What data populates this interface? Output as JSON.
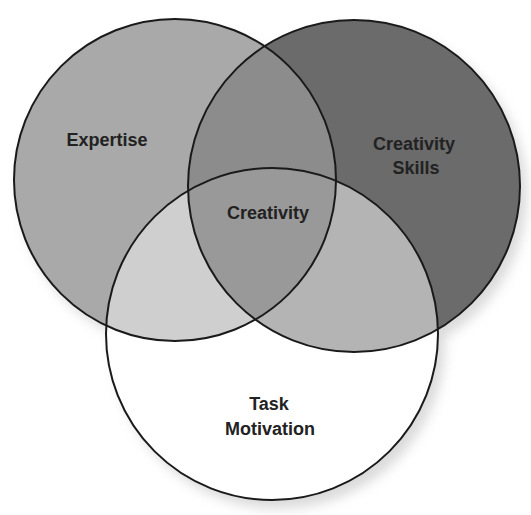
{
  "diagram": {
    "type": "venn",
    "colors": {
      "background": "#ffffff",
      "outline": "#1a1a1a",
      "expertise_only": "#a9a9a9",
      "skills_only": "#6b6b6b",
      "task_only": "#ffffff",
      "expertise_skills": "#8c8c8c",
      "expertise_task": "#cfcfcf",
      "skills_task": "#b4b4b4",
      "center": "#999999",
      "shadow": "#c8c8c8"
    },
    "circles": [
      {
        "id": "expertise",
        "label_lines": [
          "Expertise"
        ],
        "cx": 175,
        "cy": 180,
        "r": 161
      },
      {
        "id": "creativity_skills",
        "label_lines": [
          "Creativity",
          "Skills"
        ],
        "cx": 354,
        "cy": 186,
        "r": 166
      },
      {
        "id": "task_motivation",
        "label_lines": [
          "Task",
          "Motivation"
        ],
        "cx": 272,
        "cy": 334,
        "r": 166
      }
    ],
    "center_label": "Creativity",
    "labels": {
      "expertise": "Expertise",
      "skills_line1": "Creativity",
      "skills_line2": "Skills",
      "center": "Creativity",
      "task_line1": "Task",
      "task_line2": "Motivation"
    }
  }
}
